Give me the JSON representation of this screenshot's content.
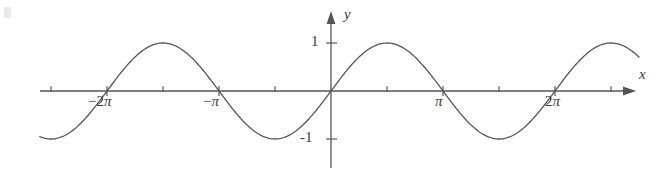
{
  "figure": {
    "background_color": "#ffffff",
    "stroke_color": "#555555",
    "text_color": "#3a3a3a",
    "width": 668,
    "height": 170
  },
  "axes": {
    "x_label": "x",
    "y_label": "y",
    "origin_px": {
      "x": 331,
      "y": 91
    },
    "pi_px": 112,
    "amplitude_px": 48
  },
  "x_ticks": [
    {
      "label": "-2π",
      "value": -6.2832,
      "text_prefix": "−2",
      "pi": "π"
    },
    {
      "label": "-π",
      "value": -3.1416,
      "text_prefix": "−",
      "pi": "π"
    },
    {
      "label": "π",
      "value": 3.1416,
      "text_prefix": "",
      "pi": "π"
    },
    {
      "label": "2π",
      "value": 6.2832,
      "text_prefix": "2",
      "pi": "π"
    }
  ],
  "y_ticks": [
    {
      "label": "1",
      "value": 1
    },
    {
      "label": "-1",
      "value": -1
    }
  ],
  "chart_data": {
    "type": "line",
    "title": "",
    "subtitle": "",
    "xlabel": "x",
    "ylabel": "y",
    "xlim": [
      -8.2,
      8.7
    ],
    "ylim": [
      -1.3,
      1.45
    ],
    "grid": false,
    "legend": null,
    "annotations": [],
    "xtick_labels": [
      "-2π",
      "-π",
      "π",
      "2π"
    ],
    "xtick_values": [
      -6.2832,
      -3.1416,
      3.1416,
      6.2832
    ],
    "xtick_minor_values": [
      -7.854,
      -4.712,
      -1.571,
      1.571,
      4.712,
      7.854
    ],
    "ytick_labels": [
      "1",
      "-1"
    ],
    "ytick_values": [
      1,
      -1
    ],
    "series": [
      {
        "name": "y = sin x",
        "function": "sin(x)",
        "amplitude": 1,
        "period": 6.2832,
        "phase": 0,
        "x_start": -8.17,
        "x_end": 8.64,
        "color": "#555555",
        "linewidth": 1.3,
        "key_points": [
          {
            "x": -8.17,
            "y": -0.965
          },
          {
            "x": -7.854,
            "y": -1
          },
          {
            "x": -6.2832,
            "y": 0
          },
          {
            "x": -4.712,
            "y": 1
          },
          {
            "x": -3.1416,
            "y": 0
          },
          {
            "x": -1.571,
            "y": -1
          },
          {
            "x": 0,
            "y": 0
          },
          {
            "x": 1.571,
            "y": 1
          },
          {
            "x": 3.1416,
            "y": 0
          },
          {
            "x": 4.712,
            "y": -1
          },
          {
            "x": 6.2832,
            "y": 0
          },
          {
            "x": 7.854,
            "y": 1
          },
          {
            "x": 8.64,
            "y": 0.71
          }
        ]
      }
    ]
  }
}
